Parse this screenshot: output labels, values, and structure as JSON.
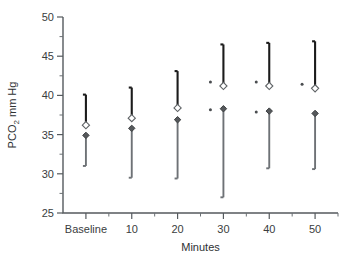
{
  "chart_data": {
    "type": "scatter",
    "title": "",
    "xlabel": "Minutes",
    "ylabel": "PCO2 mm Hg",
    "ylabel_main": "PCO",
    "ylabel_sub": "2",
    "ylabel_unit": " mm Hg",
    "categories": [
      "Baseline",
      "10",
      "20",
      "30",
      "40",
      "50"
    ],
    "ylim": [
      25,
      50
    ],
    "yticks": [
      25,
      30,
      35,
      40,
      45,
      50
    ],
    "ytick_labels": [
      "25",
      "30",
      "35",
      "40",
      "45",
      "50"
    ],
    "yminor_step": 2.5,
    "grid": false,
    "legend": "none",
    "series": [
      {
        "name": "open-diamond",
        "marker": "open diamond",
        "color": "#ffffff",
        "edge_color": "#5f6366",
        "errorbar_direction": "up",
        "errorbar_color": "#1b1b1b",
        "values": [
          36.2,
          37.1,
          38.4,
          41.2,
          41.2,
          40.9
        ],
        "errorbar_upper": [
          40.1,
          41.0,
          43.1,
          46.5,
          46.7,
          46.9
        ],
        "significance": [
          false,
          false,
          false,
          true,
          true,
          true
        ]
      },
      {
        "name": "filled-diamond",
        "marker": "filled diamond",
        "color": "#55585b",
        "edge_color": "#3c3f41",
        "errorbar_direction": "down",
        "errorbar_color": "#6e7276",
        "values": [
          34.9,
          35.8,
          36.9,
          38.3,
          38.0,
          37.7
        ],
        "errorbar_lower": [
          31.0,
          29.5,
          29.4,
          27.0,
          30.7,
          30.6
        ],
        "significance": [
          false,
          false,
          false,
          true,
          true,
          false
        ]
      }
    ],
    "annotations": {
      "significance_marker": "*"
    }
  }
}
